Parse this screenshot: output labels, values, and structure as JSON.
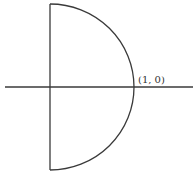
{
  "diagram": {
    "type": "contour",
    "colors": {
      "stroke": "#3a3a3a",
      "background": "#ffffff",
      "label": "#333333"
    },
    "axis": {
      "horizontal": {
        "x1": 5,
        "x2": 193,
        "y": 87
      }
    },
    "contour": {
      "vertical_segment": {
        "x": 50,
        "y1": 4,
        "y2": 170
      },
      "arc": {
        "cx": 50,
        "cy": 87,
        "r": 84
      }
    },
    "labels": [
      {
        "text": "(1, 0)",
        "x": 138,
        "y": 83
      }
    ]
  }
}
